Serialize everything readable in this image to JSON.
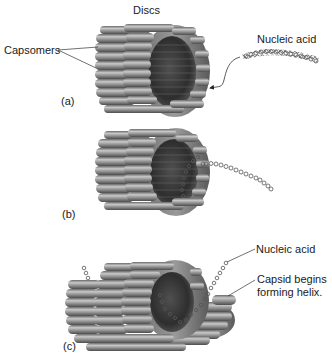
{
  "figure": {
    "panels": [
      {
        "id": "a",
        "label": "(a)",
        "annotations": {
          "discs": "Discs",
          "capsomers": "Capsomers",
          "nucleic_acid": "Nucleic acid"
        }
      },
      {
        "id": "b",
        "label": "(b)"
      },
      {
        "id": "c",
        "label": "(c)",
        "annotations": {
          "nucleic_acid": "Nucleic acid",
          "capsid_line1": "Capsid begins",
          "capsid_line2": "forming helix."
        }
      }
    ],
    "colors": {
      "capsomer_fill": "#8c8c8c",
      "capsomer_highlight": "#c4c4c4",
      "capsomer_shadow": "#4a4a4a",
      "interior": "#3a3a3a",
      "line": "#333333",
      "background": "#ffffff"
    }
  }
}
